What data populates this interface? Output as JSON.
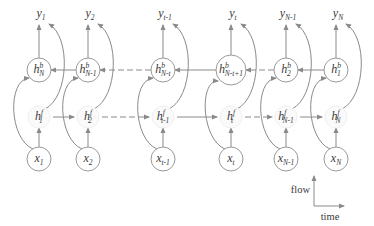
{
  "diagram": {
    "colors": {
      "line": "#8a8a8a",
      "circle_stroke": "#9a9a9a",
      "text": "#3a3a3a",
      "background": "#ffffff"
    },
    "columns": [
      {
        "x": 39,
        "output": {
          "base": "y",
          "sub": "1"
        },
        "backward": {
          "base": "h",
          "sup": "b",
          "sub": "N"
        },
        "forward": {
          "base": "h",
          "sup": "f",
          "sub": "1"
        },
        "input": {
          "base": "x",
          "sub": "1"
        }
      },
      {
        "x": 88,
        "output": {
          "base": "y",
          "sub": "2"
        },
        "backward": {
          "base": "h",
          "sup": "b",
          "sub": "N-1"
        },
        "forward": {
          "base": "h",
          "sup": "f",
          "sub": "2"
        },
        "input": {
          "base": "x",
          "sub": "2"
        }
      },
      {
        "x": 163,
        "output": {
          "base": "y",
          "sub": "t-1"
        },
        "backward": {
          "base": "h",
          "sup": "b",
          "sub": "N-t"
        },
        "forward": {
          "base": "h",
          "sup": "f",
          "sub": "t-1"
        },
        "input": {
          "base": "x",
          "sub": "t-1"
        }
      },
      {
        "x": 231,
        "output": {
          "base": "y",
          "sub": "t"
        },
        "backward": {
          "base": "h",
          "sup": "b",
          "sub": "N-t+1"
        },
        "forward": {
          "base": "h",
          "sup": "f",
          "sub": "t"
        },
        "input": {
          "base": "x",
          "sub": "t"
        }
      },
      {
        "x": 286,
        "output": {
          "base": "y",
          "sub": "N-1"
        },
        "backward": {
          "base": "h",
          "sup": "b",
          "sub": "2"
        },
        "forward": {
          "base": "h",
          "sup": "f",
          "sub": "N-1"
        },
        "input": {
          "base": "x",
          "sub": "N-1"
        }
      },
      {
        "x": 336,
        "output": {
          "base": "y",
          "sub": "N"
        },
        "backward": {
          "base": "h",
          "sup": "b",
          "sub": "1"
        },
        "forward": {
          "base": "h",
          "sup": "f",
          "sub": "N"
        },
        "input": {
          "base": "x",
          "sub": "N"
        }
      }
    ],
    "rows": {
      "output_y": 17,
      "backward_y": 70,
      "forward_y": 117,
      "input_y": 159
    },
    "dashed_gaps": [
      [
        1,
        2
      ],
      [
        3,
        4
      ]
    ],
    "legend": {
      "vertical_label": "flow",
      "horizontal_label": "time"
    }
  }
}
